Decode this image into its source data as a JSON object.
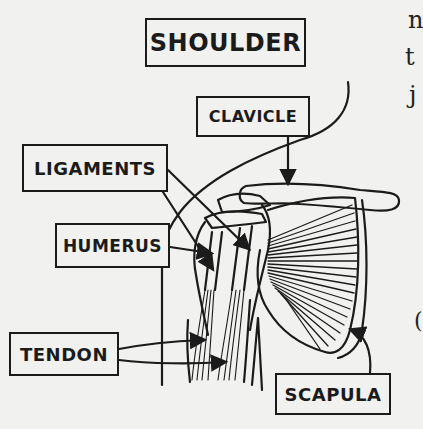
{
  "diagram": {
    "title": "SHOULDER",
    "labels": {
      "clavicle": "CLAVICLE",
      "ligaments": "LIGAMENTS",
      "humerus": "HUMERUS",
      "tendon": "TENDON",
      "scapula": "SCAPULA"
    },
    "ink_color": "#1b1b1b",
    "paper_color": "#f1f1ef"
  },
  "side_text_fragments": [
    "n",
    "t",
    "j",
    "("
  ]
}
